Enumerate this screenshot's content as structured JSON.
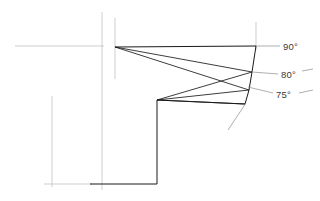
{
  "drawing": {
    "title": "Tool cutting edge angle section detail",
    "background_color": "#ffffff",
    "outline_color": "#1a1a1a",
    "construction_color": "#b9b9bd",
    "leader_color": "#8d8d92",
    "text_color": "#3a3a3a",
    "width": 320,
    "height": 201
  },
  "annotations": [
    {
      "id": "ang90",
      "name": "angle-label-90",
      "text": "90°",
      "x": 283,
      "y": 41
    },
    {
      "id": "ang80",
      "name": "angle-label-80",
      "text": "80°",
      "x": 281,
      "y": 69
    },
    {
      "id": "ang75",
      "name": "angle-label-75",
      "text": "75°",
      "x": 276,
      "y": 89
    }
  ],
  "geometry": {
    "apex_top": {
      "x": 115,
      "y": 47
    },
    "apex_bottom": {
      "x": 157,
      "y": 100
    },
    "top_right": {
      "x": 256,
      "y": 46
    },
    "mid_right": {
      "x": 252,
      "y": 72
    },
    "low_right": {
      "x": 249,
      "y": 90
    },
    "bottom_right": {
      "x": 245,
      "y": 104
    },
    "base_left": {
      "x": 90,
      "y": 184
    },
    "base_right": {
      "x": 157,
      "y": 184
    },
    "outline_path": "M115,47 L256,46 L252,72 L249,90 L245,104 L157,100 L157,184 L90,184",
    "facet_lines": [
      {
        "name": "facet-90",
        "from": "apex_top",
        "to": "mid_right"
      },
      {
        "name": "facet-80",
        "from": "apex_top",
        "to": "low_right"
      },
      {
        "name": "facet-75",
        "from": "apex_bottom",
        "to": "mid_right"
      },
      {
        "name": "facet-low",
        "from": "apex_bottom",
        "to": "low_right"
      },
      {
        "name": "facet-base",
        "from": "apex_bottom",
        "to": "bottom_right"
      }
    ],
    "center_lines": [
      {
        "name": "centerline-horizontal",
        "x1": 15,
        "y1": 46,
        "x2": 104,
        "y2": 46
      },
      {
        "name": "centerline-vertical-outer",
        "x1": 102,
        "y1": 12,
        "x2": 102,
        "y2": 190
      },
      {
        "name": "centerline-vertical-inner",
        "x1": 115,
        "y1": 18,
        "x2": 115,
        "y2": 79
      },
      {
        "name": "centerline-vertical-left",
        "x1": 52,
        "y1": 96,
        "x2": 52,
        "y2": 187
      },
      {
        "name": "centerline-horizontal-base",
        "x1": 44,
        "y1": 184,
        "x2": 92,
        "y2": 184
      },
      {
        "name": "centerline-vertical-right",
        "x1": 256,
        "y1": 22,
        "x2": 256,
        "y2": 50
      }
    ],
    "leader_lines": [
      {
        "name": "leader-90",
        "x1": 256,
        "y1": 46,
        "x2": 279,
        "y2": 46
      },
      {
        "name": "leader-80",
        "x1": 252,
        "y1": 72,
        "x2": 277,
        "y2": 73
      },
      {
        "name": "leader-80-tail",
        "x1": 301,
        "y1": 72,
        "x2": 312,
        "y2": 70
      },
      {
        "name": "leader-75",
        "x1": 248,
        "y1": 88,
        "x2": 273,
        "y2": 93
      },
      {
        "name": "leader-75-tail",
        "x1": 299,
        "y1": 93,
        "x2": 312,
        "y2": 91
      },
      {
        "name": "leader-corner",
        "x1": 245,
        "y1": 104,
        "x2": 228,
        "y2": 130
      }
    ]
  }
}
